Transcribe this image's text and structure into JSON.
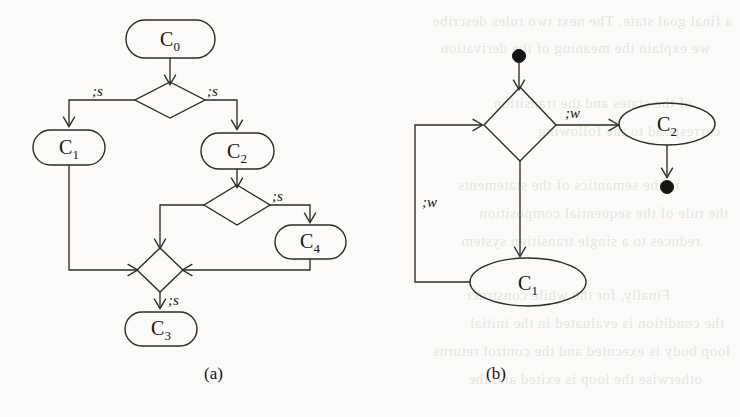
{
  "figure": {
    "caption_a": "(a)",
    "caption_b": "(b)"
  },
  "diagram_a": {
    "nodes": [
      {
        "id": "c0",
        "label": "C",
        "sub": "0",
        "shape": "rounded-rect"
      },
      {
        "id": "c1",
        "label": "C",
        "sub": "1",
        "shape": "rounded-rect"
      },
      {
        "id": "c2",
        "label": "C",
        "sub": "2",
        "shape": "rounded-rect"
      },
      {
        "id": "c3",
        "label": "C",
        "sub": "3",
        "shape": "rounded-rect"
      },
      {
        "id": "c4",
        "label": "C",
        "sub": "4",
        "shape": "rounded-rect"
      },
      {
        "id": "d1",
        "label": "",
        "shape": "diamond"
      },
      {
        "id": "d2",
        "label": "",
        "shape": "diamond"
      },
      {
        "id": "d3",
        "label": "",
        "shape": "diamond"
      }
    ],
    "edge_labels": [
      {
        "id": "a-lbl-1",
        "text": ";s"
      },
      {
        "id": "a-lbl-2",
        "text": ";s"
      },
      {
        "id": "a-lbl-3",
        "text": ";s"
      },
      {
        "id": "a-lbl-4",
        "text": ";s"
      }
    ]
  },
  "diagram_b": {
    "nodes": [
      {
        "id": "start",
        "label": "",
        "shape": "filled-circle"
      },
      {
        "id": "bd1",
        "label": "",
        "shape": "diamond"
      },
      {
        "id": "bc2",
        "label": "C",
        "sub": "2",
        "shape": "ellipse"
      },
      {
        "id": "bc1",
        "label": "C",
        "sub": "1",
        "shape": "ellipse"
      },
      {
        "id": "end",
        "label": "",
        "shape": "filled-circle"
      }
    ],
    "edge_labels": [
      {
        "id": "b-lbl-1",
        "text": ";w"
      },
      {
        "id": "b-lbl-2",
        "text": ";w"
      }
    ]
  },
  "bleed_lines": [
    {
      "x": 8,
      "y": 18,
      "text": "a final goal state. The  next  two   rules    describe"
    },
    {
      "x": 8,
      "y": 45,
      "text": "we  explain   the  meaning   of  the  derivation"
    },
    {
      "x": 8,
      "y": 100,
      "text": "of the states  and the  transition"
    },
    {
      "x": 8,
      "y": 128,
      "text": "correspond  to  the  following"
    },
    {
      "x": 8,
      "y": 182,
      "text": "in  the  semantics  of  the  statements"
    },
    {
      "x": 8,
      "y": 210,
      "text": "the  rule  of  the  sequential   composition"
    },
    {
      "x": 8,
      "y": 238,
      "text": "reduces  to  a  single  transition  system"
    },
    {
      "x": 8,
      "y": 292,
      "text": "Finally, for  the  while   construct"
    },
    {
      "x": 8,
      "y": 320,
      "text": "the  condition   is  evaluated   in  the  initial"
    },
    {
      "x": 8,
      "y": 348,
      "text": "loop body is executed  and  the  control  returns"
    },
    {
      "x": 8,
      "y": 376,
      "text": "otherwise  the  loop  is  exited  and  the"
    }
  ]
}
